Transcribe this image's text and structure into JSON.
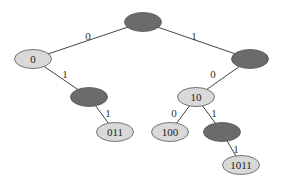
{
  "diagram": {
    "type": "binary-trie",
    "colors": {
      "internal": "#6b6b6b",
      "leaf": "#d9d9d9",
      "stroke": "#555555",
      "edge": "#444444"
    },
    "nodes": [
      {
        "id": "root",
        "label": "",
        "cx": 143,
        "cy": 22,
        "kind": "internal"
      },
      {
        "id": "n0",
        "label": "0",
        "cx": 33,
        "cy": 59,
        "kind": "leaf"
      },
      {
        "id": "n1",
        "label": "",
        "cx": 250,
        "cy": 59,
        "kind": "internal"
      },
      {
        "id": "n01",
        "label": "",
        "cx": 89,
        "cy": 97,
        "kind": "internal"
      },
      {
        "id": "n10",
        "label": "10",
        "cx": 196,
        "cy": 97,
        "kind": "leaf"
      },
      {
        "id": "n011",
        "label": "011",
        "cx": 115,
        "cy": 132,
        "kind": "leaf"
      },
      {
        "id": "n100",
        "label": "100",
        "cx": 170,
        "cy": 132,
        "kind": "leaf"
      },
      {
        "id": "n101",
        "label": "",
        "cx": 222,
        "cy": 132,
        "kind": "internal"
      },
      {
        "id": "n1011",
        "label": "1011",
        "cx": 241,
        "cy": 165,
        "kind": "leaf"
      }
    ],
    "edges": [
      {
        "from": "root",
        "to": "n0",
        "label": "0",
        "lx": 88,
        "ly": 40
      },
      {
        "from": "root",
        "to": "n1",
        "label": "1",
        "lx": 194,
        "ly": 40
      },
      {
        "from": "n0",
        "to": "n01",
        "label": "1",
        "lx": 65,
        "ly": 78
      },
      {
        "from": "n1",
        "to": "n10",
        "label": "0",
        "lx": 213,
        "ly": 78
      },
      {
        "from": "n01",
        "to": "n011",
        "label": "1",
        "lx": 108,
        "ly": 117
      },
      {
        "from": "n10",
        "to": "n100",
        "label": "0",
        "lx": 174,
        "ly": 117
      },
      {
        "from": "n10",
        "to": "n101",
        "label": "1",
        "lx": 214,
        "ly": 117
      },
      {
        "from": "n101",
        "to": "n1011",
        "label": "1",
        "lx": 236,
        "ly": 153
      }
    ]
  }
}
